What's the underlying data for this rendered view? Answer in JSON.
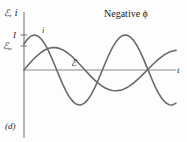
{
  "figure": {
    "panel_label": "(d)",
    "annotation": "Negative ϕ",
    "axis_y_label": "ℰ, i",
    "axis_x_label": "t",
    "tick_labels": {
      "current_amplitude": "I",
      "emf_amplitude_symbol": "ℰ",
      "emf_amplitude_subscript": "m"
    },
    "curve_labels": {
      "current": "i",
      "emf": "ℰ"
    },
    "colors": {
      "curve": "#6b6a68",
      "axis": "#7d7c7a",
      "text": "#1a1a1a",
      "background": "#fdfdfd"
    }
  },
  "chart_data": {
    "type": "line",
    "title": "Negative ϕ",
    "xlabel": "t",
    "ylabel": "ℰ, i",
    "grid": false,
    "legend": "inline-curve-labels",
    "xlim": [
      0,
      4.3
    ],
    "ylim": [
      -1.12,
      1.12
    ],
    "x": [
      0,
      0.1,
      0.2,
      0.3,
      0.4,
      0.5,
      0.6,
      0.7,
      0.8,
      0.9,
      1.0,
      1.1,
      1.2,
      1.3,
      1.4,
      1.5,
      1.6,
      1.7,
      1.8,
      1.9,
      2.0,
      2.1,
      2.2,
      2.3,
      2.4,
      2.5,
      2.6,
      2.7,
      2.8,
      2.9,
      3.0,
      3.1,
      3.2,
      3.3,
      3.4,
      3.5,
      3.6,
      3.7,
      3.8,
      3.9,
      4.0,
      4.1,
      4.2,
      4.3
    ],
    "series": [
      {
        "name": "i",
        "label": "i",
        "amplitude_label": "I",
        "amplitude": 1.0,
        "phase_deg": 48,
        "description": "current leads the emf",
        "values": [
          0.743,
          0.883,
          0.972,
          1.0,
          0.966,
          0.872,
          0.723,
          0.53,
          0.306,
          0.064,
          -0.182,
          -0.417,
          -0.625,
          -0.796,
          -0.918,
          -0.988,
          -1.0,
          -0.954,
          -0.853,
          -0.702,
          -0.509,
          -0.286,
          -0.043,
          0.202,
          0.435,
          0.639,
          0.806,
          0.924,
          0.99,
          1.0,
          0.951,
          0.846,
          0.692,
          0.495,
          0.269,
          0.025,
          -0.221,
          -0.452,
          -0.654,
          -0.815,
          -0.929,
          -0.991,
          -0.998,
          -0.947
        ]
      },
      {
        "name": "emf",
        "label": "ℰ",
        "amplitude_label": "ℰm",
        "amplitude": 0.88,
        "phase_deg": 0,
        "description": "driving emf, lags the current",
        "values": [
          0.0,
          0.173,
          0.341,
          0.497,
          0.635,
          0.752,
          0.842,
          0.903,
          0.933,
          0.932,
          0.9,
          0.838,
          0.749,
          0.635,
          0.502,
          0.356,
          0.2,
          0.041,
          -0.12,
          -0.275,
          -0.42,
          -0.55,
          -0.661,
          -0.75,
          -0.815,
          -0.854,
          -0.866,
          -0.851,
          -0.81,
          -0.743,
          -0.653,
          -0.543,
          -0.416,
          -0.277,
          -0.13,
          0.02,
          0.169,
          0.312,
          0.444,
          0.561,
          0.66,
          0.737,
          0.79,
          0.817
        ]
      }
    ]
  }
}
